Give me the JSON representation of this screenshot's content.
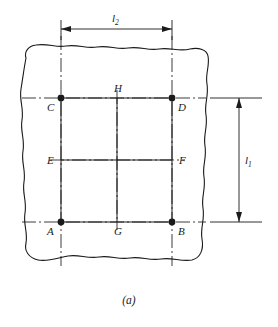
{
  "figure": {
    "caption": "(a)",
    "type": "engineering-drawing"
  },
  "dimensions": [
    {
      "id": "l2",
      "symbol": "l",
      "subscript": "2",
      "orientation": "horizontal",
      "position": "top",
      "arrows": "both",
      "from_point": "C",
      "to_point": "D"
    },
    {
      "id": "l1",
      "symbol": "l",
      "subscript": "1",
      "orientation": "vertical",
      "position": "right",
      "arrows": "both",
      "from_point": "A",
      "to_point": "C"
    }
  ],
  "points": [
    {
      "label": "A",
      "x": 61,
      "y": 222,
      "marker": "dot",
      "label_dx": -14,
      "label_dy": 13
    },
    {
      "label": "B",
      "x": 172,
      "y": 222,
      "marker": "dot",
      "label_dx": 6,
      "label_dy": 13
    },
    {
      "label": "C",
      "x": 61,
      "y": 98,
      "marker": "dot",
      "label_dx": -14,
      "label_dy": 13
    },
    {
      "label": "D",
      "x": 172,
      "y": 98,
      "marker": "dot",
      "label_dx": 6,
      "label_dy": 13
    },
    {
      "label": "E",
      "x": 61,
      "y": 160,
      "marker": "none",
      "label_dx": -14,
      "label_dy": 4
    },
    {
      "label": "F",
      "x": 172,
      "y": 160,
      "marker": "none",
      "label_dx": 7,
      "label_dy": 4
    },
    {
      "label": "G",
      "x": 117,
      "y": 222,
      "marker": "none",
      "label_dx": -3,
      "label_dy": 13
    },
    {
      "label": "H",
      "x": 117,
      "y": 98,
      "marker": "none",
      "label_dx": -3,
      "label_dy": -6
    }
  ],
  "colors": {
    "line": "#1a1a1a",
    "background": "#ffffff"
  }
}
